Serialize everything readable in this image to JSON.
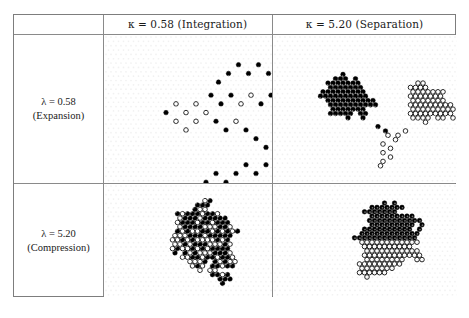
{
  "figure": {
    "title": "",
    "columns": [
      {
        "key": "corner",
        "label": ""
      },
      {
        "key": "integration",
        "label": "κ = 0.58 (Integration)"
      },
      {
        "key": "separation",
        "label": "κ = 5.20 (Separation)"
      }
    ],
    "rows": [
      {
        "key": "expansion",
        "line1": "λ = 0.58",
        "line2": "(Expansion)"
      },
      {
        "key": "compression",
        "line1": "λ = 5.20",
        "line2": "(Compression)"
      }
    ],
    "colors": {
      "filled_agent": "#000000",
      "open_agent": "#ffffff",
      "agent_outline": "#000000",
      "border": "#7d7d7d",
      "grid_line": "#8a8a8a",
      "lattice_dot": "#e3e3e3",
      "background": "#ffffff"
    },
    "bleed_text": {
      "top": "",
      "bottom": ""
    }
  },
  "chart_data": {
    "type": "scatter",
    "title": "",
    "xlabel": "",
    "ylabel": "",
    "lattice": {
      "type": "hexagonal",
      "spacing": 5.0,
      "row_offset": 2.5,
      "dot_radius": 2.3
    },
    "panels": [
      {
        "id": "p11",
        "row": "expansion",
        "column": "integration",
        "kappa": 0.58,
        "lambda": 0.58,
        "regime": "Expansion / Integration",
        "pattern": "sparse branching dendritic network, black and white agents fully intermixed",
        "n_filled": 86,
        "n_open": 64,
        "points": [
          [
            30,
            5,
            0
          ],
          [
            32,
            3,
            1
          ],
          [
            33,
            7,
            1
          ],
          [
            35,
            5,
            1
          ],
          [
            30,
            9,
            0
          ],
          [
            28,
            7,
            0
          ],
          [
            26,
            5,
            0
          ],
          [
            24,
            7,
            0
          ],
          [
            22,
            5,
            0
          ],
          [
            20,
            7,
            0
          ],
          [
            18,
            9,
            0
          ],
          [
            17,
            12,
            0
          ],
          [
            19,
            14,
            0
          ],
          [
            21,
            12,
            0
          ],
          [
            23,
            14,
            1
          ],
          [
            25,
            12,
            1
          ],
          [
            27,
            14,
            0
          ],
          [
            29,
            12,
            0
          ],
          [
            31,
            14,
            0
          ],
          [
            33,
            12,
            1
          ],
          [
            35,
            14,
            0
          ],
          [
            37,
            12,
            0
          ],
          [
            39,
            14,
            1
          ],
          [
            41,
            12,
            0
          ],
          [
            43,
            14,
            0
          ],
          [
            45,
            12,
            0
          ],
          [
            47,
            14,
            0
          ],
          [
            49,
            12,
            0
          ],
          [
            51,
            14,
            0
          ],
          [
            53,
            12,
            0
          ],
          [
            55,
            10,
            0
          ],
          [
            57,
            12,
            0
          ],
          [
            56,
            8,
            0
          ],
          [
            58,
            6,
            0
          ],
          [
            57,
            4,
            0
          ],
          [
            59,
            2,
            0
          ],
          [
            61,
            4,
            0
          ],
          [
            62,
            7,
            0
          ],
          [
            60,
            9,
            0
          ],
          [
            62,
            11,
            0
          ],
          [
            60,
            13,
            0
          ],
          [
            62,
            15,
            1
          ],
          [
            60,
            17,
            1
          ],
          [
            58,
            19,
            1
          ],
          [
            56,
            21,
            1
          ],
          [
            54,
            19,
            1
          ],
          [
            52,
            21,
            1
          ],
          [
            50,
            23,
            1
          ],
          [
            52,
            25,
            1
          ],
          [
            54,
            27,
            1
          ],
          [
            56,
            25,
            1
          ],
          [
            58,
            27,
            1
          ],
          [
            56,
            29,
            1
          ],
          [
            54,
            31,
            1
          ],
          [
            56,
            33,
            1
          ],
          [
            58,
            35,
            0
          ],
          [
            60,
            33,
            0
          ],
          [
            62,
            31,
            0
          ],
          [
            64,
            33,
            1
          ],
          [
            62,
            35,
            1
          ],
          [
            60,
            37,
            1
          ],
          [
            58,
            39,
            0
          ],
          [
            56,
            41,
            1
          ],
          [
            54,
            43,
            1
          ],
          [
            52,
            45,
            1
          ],
          [
            50,
            47,
            0
          ],
          [
            48,
            49,
            0
          ],
          [
            46,
            51,
            0
          ],
          [
            48,
            53,
            0
          ],
          [
            50,
            55,
            1
          ],
          [
            52,
            57,
            1
          ],
          [
            50,
            59,
            0
          ],
          [
            48,
            61,
            0
          ],
          [
            50,
            63,
            1
          ],
          [
            52,
            65,
            1
          ],
          [
            50,
            67,
            1
          ],
          [
            14,
            14,
            1
          ],
          [
            12,
            16,
            1
          ],
          [
            10,
            14,
            1
          ],
          [
            8,
            16,
            0
          ],
          [
            10,
            18,
            1
          ],
          [
            12,
            20,
            1
          ],
          [
            14,
            18,
            1
          ],
          [
            16,
            16,
            1
          ],
          [
            18,
            18,
            0
          ],
          [
            20,
            20,
            0
          ],
          [
            22,
            18,
            1
          ],
          [
            24,
            20,
            0
          ],
          [
            26,
            22,
            0
          ],
          [
            28,
            24,
            0
          ],
          [
            30,
            26,
            0
          ],
          [
            28,
            28,
            0
          ],
          [
            26,
            30,
            0
          ],
          [
            24,
            28,
            0
          ],
          [
            22,
            30,
            0
          ],
          [
            20,
            32,
            0
          ],
          [
            18,
            30,
            0
          ],
          [
            16,
            32,
            0
          ],
          [
            18,
            34,
            0
          ],
          [
            20,
            36,
            0
          ],
          [
            22,
            34,
            0
          ],
          [
            24,
            36,
            0
          ],
          [
            26,
            34,
            0
          ],
          [
            28,
            36,
            1
          ],
          [
            30,
            34,
            1
          ],
          [
            32,
            32,
            0
          ],
          [
            34,
            34,
            0
          ],
          [
            36,
            36,
            0
          ],
          [
            38,
            34,
            1
          ],
          [
            40,
            36,
            1
          ],
          [
            42,
            34,
            1
          ],
          [
            44,
            36,
            1
          ],
          [
            46,
            34,
            0
          ],
          [
            48,
            32,
            0
          ],
          [
            46,
            30,
            1
          ],
          [
            44,
            32,
            1
          ],
          [
            42,
            30,
            0
          ],
          [
            40,
            28,
            0
          ],
          [
            38,
            30,
            0
          ],
          [
            36,
            28,
            0
          ]
        ]
      },
      {
        "id": "p12",
        "row": "expansion",
        "column": "separation",
        "kappa": 5.2,
        "lambda": 5.2,
        "regime": "Expansion / Separation",
        "pattern": "two spatially distinct clusters — dense black blob on the left, open-circle blob on the right, joined by a thin bridge",
        "n_filled": 74,
        "n_open": 66
      },
      {
        "id": "p21",
        "row": "compression",
        "column": "integration",
        "kappa": 0.58,
        "lambda": 5.2,
        "regime": "Compression / Integration",
        "pattern": "single dense compact blob with black and white agents thoroughly intermixed",
        "n_filled": 78,
        "n_open": 80
      },
      {
        "id": "p22",
        "row": "compression",
        "column": "separation",
        "kappa": 5.2,
        "lambda": 5.2,
        "regime": "Compression / Separation",
        "pattern": "single dense compact blob cleanly segregated — black agents occupy the upper region, open agents the lower region",
        "n_filled": 80,
        "n_open": 78
      }
    ]
  }
}
